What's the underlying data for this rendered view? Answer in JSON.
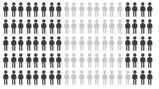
{
  "chart_data": {
    "type": "pictogram",
    "title": "",
    "subtitle": "",
    "xlabel": "",
    "ylabel": "",
    "legend": [
      {
        "label": "Highlighted",
        "color": "#3a3a3a"
      },
      {
        "label": "Remainder",
        "color": "#c8c8c8"
      }
    ],
    "icon": "person-icon",
    "rows": 5,
    "columns": 20,
    "total_icons": 100,
    "dark_color": "#3a3a3a",
    "light_color": "#c8c8c8",
    "background": "#ffffff",
    "dark_count": 59,
    "light_count": 41,
    "dark_percent": 59,
    "light_percent": 41,
    "grid": [
      [
        "dark",
        "dark",
        "dark",
        "dark",
        "dark",
        "dark",
        "dark",
        "dark",
        "light",
        "light",
        "light",
        "light",
        "light",
        "light",
        "light",
        "light",
        "dark",
        "dark",
        "dark",
        "dark"
      ],
      [
        "dark",
        "dark",
        "dark",
        "dark",
        "dark",
        "dark",
        "dark",
        "dark",
        "light",
        "light",
        "light",
        "light",
        "light",
        "light",
        "light",
        "light",
        "dark",
        "dark",
        "dark",
        "dark"
      ],
      [
        "dark",
        "dark",
        "dark",
        "dark",
        "dark",
        "dark",
        "dark",
        "dark",
        "light",
        "light",
        "light",
        "light",
        "light",
        "light",
        "light",
        "light",
        "dark",
        "dark",
        "dark",
        "dark"
      ],
      [
        "dark",
        "dark",
        "dark",
        "dark",
        "dark",
        "dark",
        "dark",
        "dark",
        "light",
        "light",
        "light",
        "light",
        "light",
        "light",
        "light",
        "light",
        "dark",
        "dark",
        "dark",
        "dark"
      ],
      [
        "dark",
        "dark",
        "dark",
        "dark",
        "dark",
        "dark",
        "dark",
        "dark",
        "light",
        "light",
        "light",
        "light",
        "light",
        "light",
        "light",
        "light",
        "light",
        "dark",
        "dark",
        "dark"
      ]
    ]
  }
}
